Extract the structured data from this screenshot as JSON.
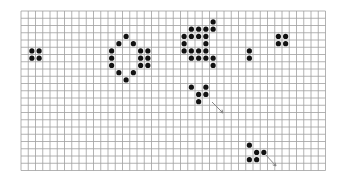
{
  "board": {
    "origin": [
      21,
      11
    ],
    "cols": 42,
    "rows": 22,
    "cell": 7.25,
    "grid_color": "#a0a0a0",
    "cell_color": "#111111",
    "arrow_color": "#888888",
    "live_cells": [
      [
        1,
        5
      ],
      [
        2,
        5
      ],
      [
        1,
        6
      ],
      [
        2,
        6
      ],
      [
        14,
        3
      ],
      [
        13,
        4
      ],
      [
        15,
        4
      ],
      [
        12,
        5
      ],
      [
        16,
        5
      ],
      [
        17,
        5
      ],
      [
        12,
        6
      ],
      [
        16,
        6
      ],
      [
        17,
        6
      ],
      [
        12,
        7
      ],
      [
        16,
        7
      ],
      [
        17,
        7
      ],
      [
        13,
        8
      ],
      [
        15,
        8
      ],
      [
        14,
        9
      ],
      [
        26,
        1
      ],
      [
        23,
        2
      ],
      [
        24,
        2
      ],
      [
        25,
        2
      ],
      [
        26,
        2
      ],
      [
        22,
        3
      ],
      [
        23,
        3
      ],
      [
        24,
        3
      ],
      [
        25,
        3
      ],
      [
        22,
        4
      ],
      [
        25,
        4
      ],
      [
        22,
        5
      ],
      [
        23,
        5
      ],
      [
        24,
        5
      ],
      [
        25,
        5
      ],
      [
        23,
        6
      ],
      [
        24,
        6
      ],
      [
        25,
        6
      ],
      [
        26,
        6
      ],
      [
        26,
        7
      ],
      [
        31,
        5
      ],
      [
        31,
        6
      ],
      [
        35,
        3
      ],
      [
        36,
        3
      ],
      [
        35,
        4
      ],
      [
        36,
        4
      ],
      [
        23,
        10
      ],
      [
        25,
        10
      ],
      [
        24,
        11
      ],
      [
        25,
        11
      ],
      [
        24,
        12
      ],
      [
        31,
        18
      ],
      [
        32,
        19
      ],
      [
        33,
        19
      ],
      [
        31,
        20
      ],
      [
        32,
        20
      ]
    ],
    "arrows": [
      {
        "from": [
          212,
          102
        ],
        "to": [
          223,
          113
        ]
      },
      {
        "from": [
          265,
          154
        ],
        "to": [
          276,
          166
        ]
      }
    ]
  }
}
